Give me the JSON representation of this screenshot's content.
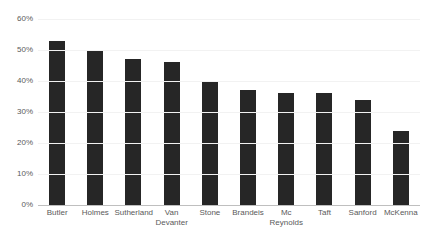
{
  "chart_data": {
    "type": "bar",
    "title": "",
    "subtitle": "",
    "xlabel": "",
    "ylabel": "",
    "ylim": [
      0,
      60
    ],
    "yticks": [
      0,
      10,
      20,
      30,
      40,
      50,
      60
    ],
    "ytick_labels": [
      "0%",
      "10%",
      "20%",
      "30%",
      "40%",
      "50%",
      "60%"
    ],
    "grid": true,
    "legend": false,
    "legend_position": "none",
    "value_format": "percent",
    "categories": [
      "Butler",
      "Holmes",
      "Sutherland",
      "Van\nDevanter",
      "Stone",
      "Brandeis",
      "Mc\nReynolds",
      "Taft",
      "Sanford",
      "McKenna"
    ],
    "values": [
      53,
      50,
      47,
      46,
      40,
      37,
      36,
      36,
      34,
      24
    ],
    "bar_color": "#262626",
    "gridline_color": "#f2f2f2",
    "axis_color": "#bfbfbf",
    "label_color": "#5a5a5a",
    "background_color": "#ffffff"
  }
}
